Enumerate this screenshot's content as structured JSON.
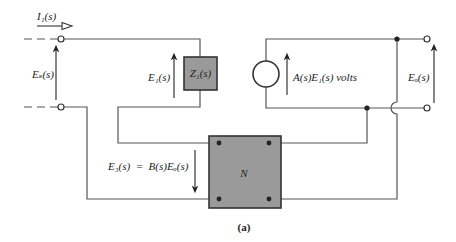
{
  "diagram": {
    "caption": "(a)",
    "colors": {
      "wire": "#555555",
      "block_fill": "#9a9a9a",
      "block_stroke": "#333333",
      "text": "#222222"
    },
    "labels": {
      "input_current": "I₁(s)",
      "source_voltage": "Eₛ(s)",
      "e1_voltage": "E₁(s)",
      "z1_block": "Z₁(s)",
      "dependent_source": "A(s)E₁(s) volts",
      "output_voltage": "Eₒ(s)",
      "feedback_voltage": "E₃(s)  =  B(s)Eₒ(s)",
      "network_block": "N"
    },
    "components": [
      {
        "id": "Z1",
        "type": "impedance-block",
        "label": "Z₁(s)"
      },
      {
        "id": "A",
        "type": "dependent-voltage-source",
        "label": "A(s)E₁(s) volts"
      },
      {
        "id": "N",
        "type": "two-port-network",
        "label": "N"
      }
    ],
    "terminals": [
      "input-top",
      "input-bottom",
      "output-top",
      "output-bottom"
    ]
  }
}
